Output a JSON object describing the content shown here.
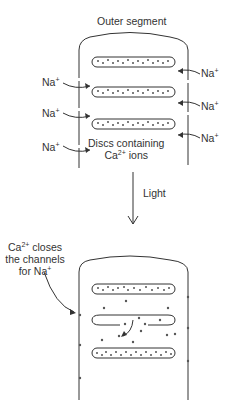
{
  "title": "Outer segment",
  "top_panel": {
    "na_left": [
      "Na",
      "Na",
      "Na"
    ],
    "na_right": [
      "Na",
      "Na",
      "Na"
    ],
    "plus": "+",
    "disc_label_line1": "Discs containing",
    "disc_label_line2_base": "Ca",
    "disc_label_line2_sup": "2+",
    "disc_label_line2_rest": " ions"
  },
  "arrow_label": "Light",
  "bottom_panel": {
    "annotation_line1_base": "Ca",
    "annotation_line1_sup": "2+",
    "annotation_line1_rest": " closes",
    "annotation_line2": "the channels",
    "annotation_line3_base": "for Na",
    "annotation_line3_sup": "+"
  },
  "colors": {
    "stroke": "#333333",
    "dot": "#555555",
    "background": "#ffffff"
  }
}
